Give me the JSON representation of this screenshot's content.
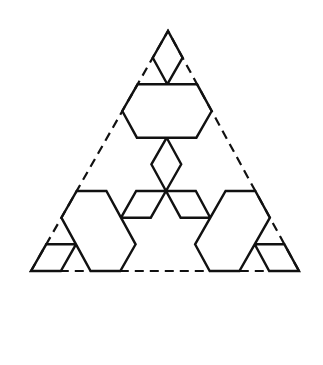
{
  "figure": {
    "background": "#ffffff",
    "stroke_color": "#111111",
    "iterations": 2,
    "base_triangle": {
      "left": [
        31,
        271
      ],
      "apex": [
        168,
        31
      ],
      "right": [
        299,
        271
      ]
    },
    "dashed_triangle_visible": true
  }
}
